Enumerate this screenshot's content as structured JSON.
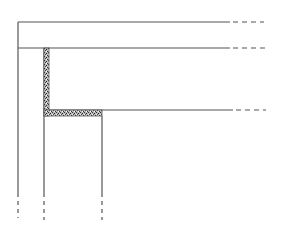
{
  "diagram": {
    "title": "",
    "colors": {
      "line": "#555555",
      "hatch_fill": "#bbbbbb",
      "hatch_dark": "#333333",
      "background": "#ffffff"
    },
    "lines": {
      "top_beam_top": {
        "y": 22,
        "x1": 18,
        "solid_end": 230,
        "dash_end": 264
      },
      "top_beam_bottom": {
        "y": 48,
        "x1": 18,
        "solid_end": 230,
        "dash_end": 265
      },
      "slab_top": {
        "y": 110,
        "x1": 49,
        "solid_end": 233,
        "dash_end": 266
      },
      "left_wall": {
        "x": 18,
        "y1": 22,
        "solid_end": 197,
        "dash_end": 218
      },
      "inner_wall": {
        "x": 44,
        "y1": 48,
        "solid_end": 197,
        "dash_end": 220
      },
      "right_wall": {
        "x": 102,
        "y1": 116,
        "solid_end": 197,
        "dash_end": 220
      }
    },
    "hatched_regions": [
      {
        "name": "vertical-filler-strip",
        "x": 44,
        "y": 48,
        "w": 5,
        "h": 68
      },
      {
        "name": "horizontal-filler-strip",
        "x": 44,
        "y": 110,
        "w": 58,
        "h": 6
      }
    ]
  }
}
